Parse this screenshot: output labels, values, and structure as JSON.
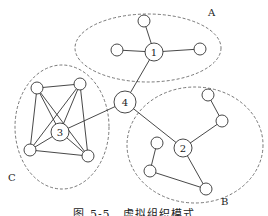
{
  "caption": "图 5-5　虚拟组织模式",
  "groups": [
    {
      "label": "A",
      "cx": 148,
      "cy": 48,
      "rx": 73,
      "ry": 34,
      "label_x": 208,
      "label_y": 16
    },
    {
      "label": "B",
      "cx": 195,
      "cy": 145,
      "rx": 68,
      "ry": 58,
      "label_x": 221,
      "label_y": 205
    },
    {
      "label": "C",
      "cx": 62,
      "cy": 127,
      "rx": 47,
      "ry": 62,
      "label_x": 8,
      "label_y": 181
    }
  ],
  "nodes": [
    {
      "id": "n1",
      "label": "1",
      "x": 154,
      "y": 52,
      "r": 9
    },
    {
      "id": "n2",
      "label": "2",
      "x": 183,
      "y": 148,
      "r": 9
    },
    {
      "id": "n3",
      "label": "3",
      "x": 60,
      "y": 132,
      "r": 9
    },
    {
      "id": "n4",
      "label": "4",
      "x": 125,
      "y": 102,
      "r": 11
    },
    {
      "id": "a1",
      "label": "",
      "x": 144,
      "y": 21,
      "r": 6
    },
    {
      "id": "a2",
      "label": "",
      "x": 117,
      "y": 50,
      "r": 6
    },
    {
      "id": "a3",
      "label": "",
      "x": 200,
      "y": 49,
      "r": 6
    },
    {
      "id": "c1",
      "label": "",
      "x": 37,
      "y": 88,
      "r": 6
    },
    {
      "id": "c2",
      "label": "",
      "x": 80,
      "y": 84,
      "r": 6
    },
    {
      "id": "c3",
      "label": "",
      "x": 30,
      "y": 150,
      "r": 6
    },
    {
      "id": "c4",
      "label": "",
      "x": 88,
      "y": 156,
      "r": 6
    },
    {
      "id": "b1",
      "label": "",
      "x": 208,
      "y": 95,
      "r": 6
    },
    {
      "id": "b2",
      "label": "",
      "x": 222,
      "y": 121,
      "r": 6
    },
    {
      "id": "b3",
      "label": "",
      "x": 157,
      "y": 143,
      "r": 6
    },
    {
      "id": "b4",
      "label": "",
      "x": 150,
      "y": 171,
      "r": 6
    },
    {
      "id": "b5",
      "label": "",
      "x": 206,
      "y": 189,
      "r": 6
    }
  ],
  "edges": [
    [
      "n1",
      "a1"
    ],
    [
      "n1",
      "a2"
    ],
    [
      "n1",
      "a3"
    ],
    [
      "n1",
      "n4"
    ],
    [
      "n4",
      "n3"
    ],
    [
      "n4",
      "n2"
    ],
    [
      "n2",
      "b2"
    ],
    [
      "b2",
      "b1"
    ],
    [
      "n2",
      "b5"
    ],
    [
      "b5",
      "b4"
    ],
    [
      "b4",
      "b3"
    ],
    [
      "c1",
      "c2"
    ],
    [
      "c1",
      "c3"
    ],
    [
      "c1",
      "c4"
    ],
    [
      "c1",
      "n3"
    ],
    [
      "c2",
      "c3"
    ],
    [
      "c2",
      "c4"
    ],
    [
      "c2",
      "n3"
    ],
    [
      "c3",
      "c4"
    ],
    [
      "c3",
      "n3"
    ],
    [
      "c4",
      "n3"
    ]
  ],
  "style": {
    "stroke": "#333333",
    "dash": "#555555",
    "fill": "#ffffff"
  }
}
